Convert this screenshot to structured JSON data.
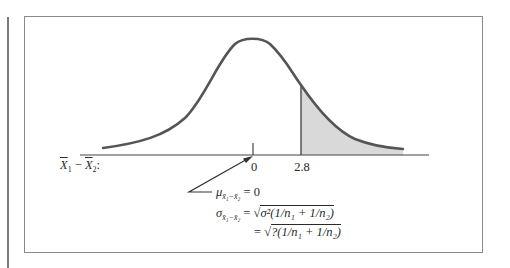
{
  "diagram": {
    "type": "normal-distribution-upper-tail",
    "axis_variable_label": {
      "X_main": "X",
      "sub1": "1",
      "minus": " − ",
      "sub2": "2",
      "colon": ":"
    },
    "ticks": [
      {
        "label": "0",
        "x": 253
      },
      {
        "label": "2.8",
        "x": 301
      }
    ],
    "shaded_region": {
      "from": "2.8",
      "to": "right tail",
      "fill": "#d9d9d9"
    },
    "curve_color": "#555555",
    "formulas": {
      "mean": {
        "symbol": "μ",
        "subscript": "x̄₁−x̄₂",
        "rhs": " = 0"
      },
      "sd": {
        "symbol": "σ",
        "subscript": "x̄₁−x̄₂",
        "equals": " = ",
        "radical": "√",
        "radicand": "σ²(1/n₁ + 1/n₂)"
      },
      "sd_numeric": {
        "equals": "= ",
        "radical": "√",
        "radicand": "?(1/n₁ + 1/n₂)"
      }
    }
  }
}
